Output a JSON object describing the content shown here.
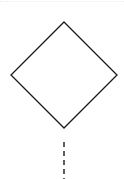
{
  "diagram": {
    "type": "flowchart-fragment",
    "nodes": [
      {
        "id": "decision",
        "shape": "diamond",
        "label": "",
        "vertices": {
          "top": [
            64,
            22
          ],
          "right": [
            117,
            75
          ],
          "bottom": [
            64,
            128
          ],
          "left": [
            11,
            75
          ]
        },
        "stroke": "#1a1a1a",
        "fill": "#ffffff"
      }
    ],
    "edges": [
      {
        "from": "decision",
        "style": "dashed",
        "start": [
          64,
          142
        ],
        "end": [
          64,
          179
        ],
        "stroke": "#1a1a1a"
      }
    ]
  },
  "colors": {
    "background": "#ffffff",
    "stroke": "#1a1a1a",
    "top_border": "#ececec"
  }
}
